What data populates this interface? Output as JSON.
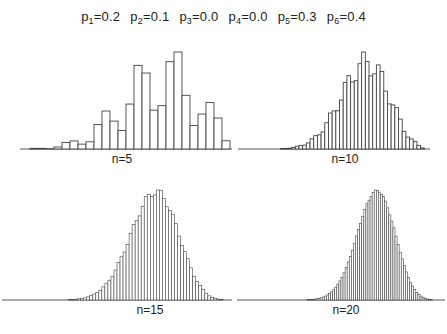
{
  "header": {
    "params": [
      {
        "name": "p",
        "sub": "1",
        "value": "=0.2"
      },
      {
        "name": "p",
        "sub": "2",
        "value": "=0.1"
      },
      {
        "name": "p",
        "sub": "3",
        "value": "=0.0"
      },
      {
        "name": "p",
        "sub": "4",
        "value": "=0.0"
      },
      {
        "name": "p",
        "sub": "5",
        "value": "=0.3"
      },
      {
        "name": "p",
        "sub": "6",
        "value": "=0.4"
      }
    ]
  },
  "panels": [
    {
      "label": "n=5"
    },
    {
      "label": "n=10"
    },
    {
      "label": "n=15"
    },
    {
      "label": "n=20"
    }
  ],
  "chart_data": {
    "type": "bar",
    "die_probabilities": [
      0.2,
      0.1,
      0.0,
      0.0,
      0.3,
      0.4
    ],
    "note": "Histograms of the sum of n rolls of a loaded six-sided die; each panel is scaled so its tallest bar reaches the same height. The n=5 values are bar heights estimated from the screenshot pixels (fraction of peak), not computed probabilities.",
    "grid": false,
    "legend": null,
    "charts": [
      {
        "label": "n=5",
        "n": 5,
        "x_range": [
          5,
          30
        ],
        "relative_heights_estimated_from_pixels": [
          0.0,
          0.0,
          0.0,
          0.02,
          0.06,
          0.08,
          0.05,
          0.07,
          0.26,
          0.36,
          0.26,
          0.15,
          0.41,
          0.81,
          0.72,
          0.35,
          0.41,
          0.89,
          1.0,
          0.57,
          0.22,
          0.33,
          0.45,
          0.3,
          0.06,
          0.0
        ]
      },
      {
        "label": "n=10",
        "n": 10,
        "x_range": [
          10,
          60
        ]
      },
      {
        "label": "n=15",
        "n": 15,
        "x_range": [
          15,
          90
        ]
      },
      {
        "label": "n=20",
        "n": 20,
        "x_range": [
          20,
          120
        ]
      }
    ]
  }
}
